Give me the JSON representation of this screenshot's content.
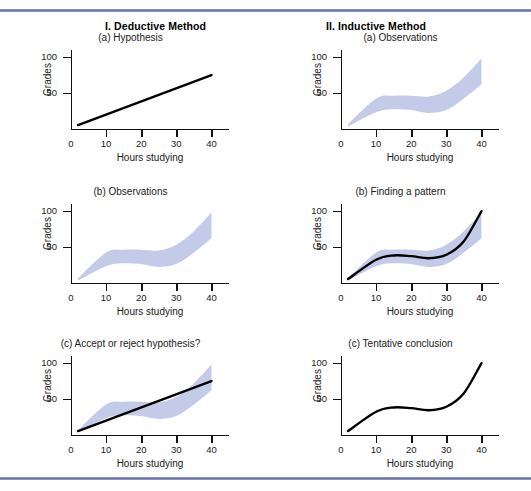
{
  "figure": {
    "columns": [
      {
        "heading": "I. Deductive Method"
      },
      {
        "heading": "II. Inductive Method"
      }
    ]
  },
  "chart_data": [
    {
      "id": "deductive-a",
      "type": "line",
      "title": "(a) Hypothesis",
      "xlabel": "Hours studying",
      "ylabel": "Grades",
      "xlim": [
        0,
        45
      ],
      "ylim": [
        0,
        110
      ],
      "xticks": [
        0,
        10,
        20,
        30,
        40
      ],
      "yticks": [
        50,
        100
      ],
      "grid": false,
      "legend": "none",
      "series": [
        {
          "name": "hypothesized linear relationship",
          "kind": "line",
          "x": [
            2,
            40
          ],
          "values": [
            5,
            75
          ]
        }
      ]
    },
    {
      "id": "inductive-a",
      "type": "area",
      "title": "(a) Observations",
      "xlabel": "Hours studying",
      "ylabel": "Grades",
      "xlim": [
        0,
        45
      ],
      "ylim": [
        0,
        110
      ],
      "xticks": [
        0,
        10,
        20,
        30,
        40
      ],
      "yticks": [
        50,
        100
      ],
      "grid": false,
      "legend": "none",
      "series": [
        {
          "name": "observation scatter band",
          "kind": "band",
          "x": [
            2,
            10,
            15,
            20,
            25,
            30,
            35,
            40
          ],
          "upper": [
            6,
            42,
            46,
            46,
            45,
            53,
            72,
            98
          ],
          "lower": [
            3,
            23,
            27,
            26,
            22,
            26,
            42,
            62
          ]
        }
      ]
    },
    {
      "id": "deductive-b",
      "type": "area",
      "title": "(b) Observations",
      "xlabel": "Hours studying",
      "ylabel": "Grades",
      "xlim": [
        0,
        45
      ],
      "ylim": [
        0,
        110
      ],
      "xticks": [
        0,
        10,
        20,
        30,
        40
      ],
      "yticks": [
        50,
        100
      ],
      "grid": false,
      "legend": "none",
      "series": [
        {
          "name": "observation scatter band",
          "kind": "band",
          "x": [
            2,
            10,
            15,
            20,
            25,
            30,
            35,
            40
          ],
          "upper": [
            6,
            42,
            46,
            46,
            45,
            53,
            72,
            98
          ],
          "lower": [
            3,
            23,
            27,
            26,
            22,
            26,
            42,
            62
          ]
        }
      ]
    },
    {
      "id": "inductive-b",
      "type": "line",
      "title": "(b) Finding a pattern",
      "xlabel": "Hours studying",
      "ylabel": "Grades",
      "xlim": [
        0,
        45
      ],
      "ylim": [
        0,
        110
      ],
      "xticks": [
        0,
        10,
        20,
        30,
        40
      ],
      "yticks": [
        50,
        100
      ],
      "grid": false,
      "legend": "none",
      "series": [
        {
          "name": "observation scatter band",
          "kind": "band",
          "x": [
            2,
            10,
            15,
            20,
            25,
            30,
            35,
            40
          ],
          "upper": [
            6,
            42,
            46,
            46,
            45,
            53,
            72,
            98
          ],
          "lower": [
            3,
            23,
            27,
            26,
            22,
            26,
            42,
            62
          ]
        },
        {
          "name": "fitted pattern curve",
          "kind": "curve",
          "x": [
            2,
            10,
            15,
            20,
            25,
            30,
            35,
            40
          ],
          "values": [
            5,
            32,
            38,
            37,
            34,
            39,
            58,
            100
          ]
        }
      ]
    },
    {
      "id": "deductive-c",
      "type": "line",
      "title": "(c) Accept or reject hypothesis?",
      "xlabel": "Hours studying",
      "ylabel": "Grades",
      "xlim": [
        0,
        45
      ],
      "ylim": [
        0,
        110
      ],
      "xticks": [
        0,
        10,
        20,
        30,
        40
      ],
      "yticks": [
        50,
        100
      ],
      "grid": false,
      "legend": "none",
      "series": [
        {
          "name": "observation scatter band",
          "kind": "band",
          "x": [
            2,
            10,
            15,
            20,
            25,
            30,
            35,
            40
          ],
          "upper": [
            6,
            42,
            46,
            46,
            45,
            53,
            72,
            98
          ],
          "lower": [
            3,
            23,
            27,
            26,
            22,
            26,
            42,
            62
          ]
        },
        {
          "name": "hypothesized linear relationship",
          "kind": "line",
          "x": [
            2,
            40
          ],
          "values": [
            5,
            75
          ]
        }
      ]
    },
    {
      "id": "inductive-c",
      "type": "line",
      "title": "(c) Tentative conclusion",
      "xlabel": "Hours studying",
      "ylabel": "Grades",
      "xlim": [
        0,
        45
      ],
      "ylim": [
        0,
        110
      ],
      "xticks": [
        0,
        10,
        20,
        30,
        40
      ],
      "yticks": [
        50,
        100
      ],
      "grid": false,
      "legend": "none",
      "series": [
        {
          "name": "tentative conclusion curve",
          "kind": "curve",
          "x": [
            2,
            10,
            15,
            20,
            25,
            30,
            35,
            40
          ],
          "values": [
            5,
            32,
            38,
            37,
            34,
            39,
            58,
            100
          ]
        }
      ]
    }
  ],
  "colors": {
    "band": "#c3cbe8",
    "curve": "#000000",
    "axis": "#111111",
    "rule": "#6b72b0",
    "text": "#222222"
  }
}
